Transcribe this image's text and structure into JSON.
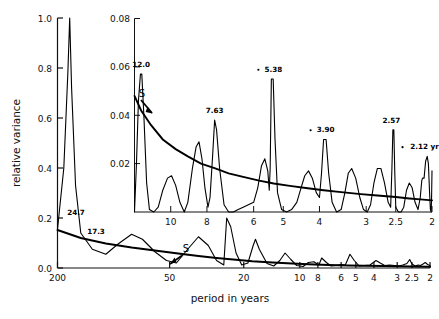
{
  "figure": {
    "xlabel": "period in years",
    "ylabel": "relative variance"
  },
  "chart_data": {
    "type": "line",
    "title": "",
    "xlabel": "period in years",
    "ylabel": "relative variance",
    "xscale": "log-reversed",
    "grid": false,
    "legend": null,
    "panels": [
      {
        "name": "main",
        "xlim": [
          200,
          2
        ],
        "ylim": [
          0.0,
          1.0
        ],
        "xticks": [
          "200",
          "50",
          "20",
          "10",
          "8",
          "6",
          "5",
          "4",
          "3",
          "2.5",
          "2"
        ],
        "yticks": [
          "0.0",
          "0.2",
          "0.4",
          "0.6",
          "0.8",
          "1.0"
        ],
        "annotations": [
          {
            "label": "24.7",
            "period": 24.7,
            "value": 0.2
          },
          {
            "label": "17.3",
            "period": 17.3,
            "value": 0.115
          },
          {
            "label": "S",
            "period": 5.9,
            "value": 0.035,
            "note": "smoothed background curve"
          }
        ],
        "series": [
          {
            "name": "relative variance spectrum",
            "points": [
              [
                200,
                0.155
              ],
              [
                185,
                0.4
              ],
              [
                176,
                0.78
              ],
              [
                172,
                1.0
              ],
              [
                168,
                0.72
              ],
              [
                160,
                0.33
              ],
              [
                150,
                0.14
              ],
              [
                130,
                0.075
              ],
              [
                110,
                0.055
              ],
              [
                95,
                0.095
              ],
              [
                80,
                0.135
              ],
              [
                70,
                0.115
              ],
              [
                60,
                0.065
              ],
              [
                52,
                0.03
              ],
              [
                46,
                0.02
              ],
              [
                40,
                0.075
              ],
              [
                35,
                0.125
              ],
              [
                31,
                0.09
              ],
              [
                28,
                0.03
              ],
              [
                25.6,
                0.012
              ],
              [
                24.7,
                0.2
              ],
              [
                23.5,
                0.165
              ],
              [
                22,
                0.06
              ],
              [
                20.5,
                0.012
              ],
              [
                19,
                0.02
              ],
              [
                17.8,
                0.09
              ],
              [
                17.3,
                0.115
              ],
              [
                16.5,
                0.075
              ],
              [
                15,
                0.018
              ],
              [
                13.8,
                0.008
              ],
              [
                12.8,
                0.03
              ],
              [
                12.0,
                0.06
              ],
              [
                11.2,
                0.035
              ],
              [
                10.4,
                0.01
              ],
              [
                9.6,
                0.006
              ],
              [
                9.0,
                0.022
              ],
              [
                8.4,
                0.025
              ],
              [
                7.9,
                0.012
              ],
              [
                7.63,
                0.04
              ],
              [
                7.2,
                0.022
              ],
              [
                6.8,
                0.008
              ],
              [
                6.4,
                0.01
              ],
              [
                6.0,
                0.014
              ],
              [
                5.7,
                0.012
              ],
              [
                5.38,
                0.055
              ],
              [
                5.1,
                0.03
              ],
              [
                4.8,
                0.008
              ],
              [
                4.5,
                0.01
              ],
              [
                4.2,
                0.012
              ],
              [
                3.9,
                0.03
              ],
              [
                3.7,
                0.02
              ],
              [
                3.5,
                0.01
              ],
              [
                3.3,
                0.012
              ],
              [
                3.1,
                0.01
              ],
              [
                2.95,
                0.008
              ],
              [
                2.8,
                0.012
              ],
              [
                2.66,
                0.018
              ],
              [
                2.57,
                0.034
              ],
              [
                2.5,
                0.016
              ],
              [
                2.4,
                0.008
              ],
              [
                2.32,
                0.012
              ],
              [
                2.25,
                0.01
              ],
              [
                2.18,
                0.016
              ],
              [
                2.12,
                0.022
              ],
              [
                2.06,
                0.014
              ],
              [
                2.0,
                0.01
              ]
            ]
          },
          {
            "name": "S smoothed background",
            "points": [
              [
                200,
                0.152
              ],
              [
                150,
                0.12
              ],
              [
                110,
                0.098
              ],
              [
                80,
                0.082
              ],
              [
                60,
                0.07
              ],
              [
                45,
                0.058
              ],
              [
                35,
                0.048
              ],
              [
                28,
                0.04
              ],
              [
                22,
                0.033
              ],
              [
                18,
                0.027
              ],
              [
                14,
                0.022
              ],
              [
                11,
                0.018
              ],
              [
                9,
                0.015
              ],
              [
                7,
                0.012
              ],
              [
                5.5,
                0.01
              ],
              [
                4.5,
                0.009
              ],
              [
                3.5,
                0.008
              ],
              [
                3.0,
                0.007
              ],
              [
                2.5,
                0.006
              ],
              [
                2.0,
                0.005
              ]
            ]
          }
        ]
      },
      {
        "name": "inset",
        "xlim": [
          12.5,
          2
        ],
        "ylim": [
          0.0,
          0.08
        ],
        "xticks": [
          "10",
          "8",
          "6",
          "5",
          "4",
          "3",
          "2.5",
          "2"
        ],
        "yticks": [
          "0.02",
          "0.04",
          "0.06",
          "0.08"
        ],
        "annotations": [
          {
            "label": "12.0",
            "period": 12.0,
            "value": 0.057
          },
          {
            "label": "7.63",
            "period": 7.63,
            "value": 0.038
          },
          {
            "label": "5.38",
            "period": 5.38,
            "value": 0.055,
            "marker": "dot"
          },
          {
            "label": "3.90",
            "period": 3.9,
            "value": 0.03,
            "marker": "dot"
          },
          {
            "label": "2.57",
            "period": 2.57,
            "value": 0.034
          },
          {
            "label": "2.12 yr",
            "period": 2.12,
            "value": 0.023,
            "marker": "dot"
          },
          {
            "label": "S",
            "period": 11.6,
            "value": 0.042,
            "note": "smoothed background curve"
          }
        ],
        "series": [
          {
            "name": "relative variance spectrum (expanded)",
            "points": [
              [
                12.5,
                0.0
              ],
              [
                12.35,
                0.02
              ],
              [
                12.2,
                0.046
              ],
              [
                12.05,
                0.057
              ],
              [
                11.95,
                0.057
              ],
              [
                11.8,
                0.04
              ],
              [
                11.6,
                0.012
              ],
              [
                11.4,
                0.001
              ],
              [
                11.1,
                0.0
              ],
              [
                10.8,
                0.002
              ],
              [
                10.5,
                0.009
              ],
              [
                10.2,
                0.014
              ],
              [
                9.95,
                0.015
              ],
              [
                9.7,
                0.011
              ],
              [
                9.45,
                0.004
              ],
              [
                9.2,
                0.0
              ],
              [
                9.0,
                0.004
              ],
              [
                8.75,
                0.018
              ],
              [
                8.55,
                0.027
              ],
              [
                8.4,
                0.029
              ],
              [
                8.25,
                0.022
              ],
              [
                8.1,
                0.01
              ],
              [
                7.95,
                0.002
              ],
              [
                7.85,
                0.006
              ],
              [
                7.72,
                0.024
              ],
              [
                7.63,
                0.038
              ],
              [
                7.54,
                0.034
              ],
              [
                7.4,
                0.018
              ],
              [
                7.2,
                0.003
              ],
              [
                7.0,
                0.0
              ],
              [
                6.8,
                0.0
              ],
              [
                6.6,
                0.001
              ],
              [
                6.4,
                0.002
              ],
              [
                6.2,
                0.003
              ],
              [
                6.0,
                0.004
              ],
              [
                5.85,
                0.01
              ],
              [
                5.72,
                0.019
              ],
              [
                5.6,
                0.022
              ],
              [
                5.5,
                0.017
              ],
              [
                5.45,
                0.009
              ],
              [
                5.42,
                0.018
              ],
              [
                5.38,
                0.055
              ],
              [
                5.32,
                0.055
              ],
              [
                5.26,
                0.03
              ],
              [
                5.18,
                0.008
              ],
              [
                5.05,
                0.001
              ],
              [
                4.9,
                0.0
              ],
              [
                4.75,
                0.001
              ],
              [
                4.6,
                0.004
              ],
              [
                4.48,
                0.01
              ],
              [
                4.38,
                0.015
              ],
              [
                4.28,
                0.017
              ],
              [
                4.18,
                0.014
              ],
              [
                4.08,
                0.008
              ],
              [
                4.0,
                0.006
              ],
              [
                3.95,
                0.016
              ],
              [
                3.9,
                0.03
              ],
              [
                3.84,
                0.03
              ],
              [
                3.78,
                0.016
              ],
              [
                3.7,
                0.004
              ],
              [
                3.6,
                0.0
              ],
              [
                3.5,
                0.001
              ],
              [
                3.42,
                0.008
              ],
              [
                3.35,
                0.016
              ],
              [
                3.28,
                0.018
              ],
              [
                3.2,
                0.014
              ],
              [
                3.12,
                0.006
              ],
              [
                3.05,
                0.001
              ],
              [
                2.98,
                0.0
              ],
              [
                2.92,
                0.003
              ],
              [
                2.86,
                0.012
              ],
              [
                2.8,
                0.018
              ],
              [
                2.74,
                0.018
              ],
              [
                2.68,
                0.012
              ],
              [
                2.62,
                0.004
              ],
              [
                2.58,
                0.002
              ],
              [
                2.56,
                0.018
              ],
              [
                2.545,
                0.034
              ],
              [
                2.53,
                0.034
              ],
              [
                2.515,
                0.016
              ],
              [
                2.5,
                0.002
              ],
              [
                2.46,
                0.0
              ],
              [
                2.42,
                0.0
              ],
              [
                2.38,
                0.002
              ],
              [
                2.34,
                0.009
              ],
              [
                2.3,
                0.012
              ],
              [
                2.26,
                0.01
              ],
              [
                2.22,
                0.004
              ],
              [
                2.18,
                0.001
              ],
              [
                2.15,
                0.006
              ],
              [
                2.13,
                0.013
              ],
              [
                2.12,
                0.014
              ],
              [
                2.1,
                0.014
              ],
              [
                2.08,
                0.021
              ],
              [
                2.06,
                0.023
              ],
              [
                2.045,
                0.02
              ],
              [
                2.03,
                0.008
              ],
              [
                2.02,
                0.001
              ],
              [
                2.01,
                0.0
              ],
              [
                2.005,
                0.006
              ],
              [
                2.0,
                0.017
              ]
            ]
          },
          {
            "name": "S smoothed background (expanded)",
            "points": [
              [
                12.5,
                0.048
              ],
              [
                12.0,
                0.042
              ],
              [
                11.3,
                0.036
              ],
              [
                10.5,
                0.03
              ],
              [
                9.7,
                0.026
              ],
              [
                9.0,
                0.023
              ],
              [
                8.3,
                0.02
              ],
              [
                7.6,
                0.018
              ],
              [
                7.0,
                0.016
              ],
              [
                6.4,
                0.0145
              ],
              [
                5.8,
                0.013
              ],
              [
                5.3,
                0.0118
              ],
              [
                4.8,
                0.0108
              ],
              [
                4.3,
                0.0098
              ],
              [
                3.9,
                0.009
              ],
              [
                3.5,
                0.0082
              ],
              [
                3.1,
                0.0074
              ],
              [
                2.8,
                0.0068
              ],
              [
                2.5,
                0.0062
              ],
              [
                2.3,
                0.0056
              ],
              [
                2.15,
                0.0052
              ],
              [
                2.0,
                0.0048
              ]
            ]
          }
        ]
      }
    ]
  }
}
